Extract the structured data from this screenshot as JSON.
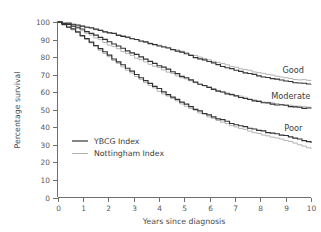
{
  "chart_data": {
    "type": "line",
    "title": "",
    "xlabel": "Years since diagnosis",
    "ylabel": "Percentage survival",
    "xlim": [
      0,
      10
    ],
    "ylim": [
      0,
      100
    ],
    "xticks": [
      "0",
      "1",
      "2",
      "3",
      "4",
      "5",
      "6",
      "7",
      "8",
      "9",
      "10"
    ],
    "yticks": [
      "0",
      "10",
      "20",
      "30",
      "40",
      "50",
      "60",
      "70",
      "80",
      "90",
      "100"
    ],
    "grid": false,
    "legend_position": "inside-lower-left",
    "legend": [
      {
        "name": "YBCG Index",
        "color": "#333333"
      },
      {
        "name": "Nottingham Index",
        "color": "#b3b3b3"
      }
    ],
    "group_annotations": [
      {
        "label": "Good",
        "x": 9.3,
        "y": 71
      },
      {
        "label": "Moderate",
        "x": 9.2,
        "y": 56
      },
      {
        "label": "Poor",
        "x": 9.3,
        "y": 38
      }
    ],
    "x": [
      0,
      0.25,
      0.5,
      0.75,
      1,
      1.25,
      1.5,
      1.75,
      2,
      2.25,
      2.5,
      2.75,
      3,
      3.25,
      3.5,
      3.75,
      4,
      4.25,
      4.5,
      4.75,
      5,
      5.25,
      5.5,
      5.75,
      6,
      6.25,
      6.5,
      6.75,
      7,
      7.25,
      7.5,
      7.75,
      8,
      8.25,
      8.5,
      8.75,
      9,
      9.25,
      9.5,
      9.75,
      10
    ],
    "series": [
      {
        "name": "YBCG Index - Good",
        "group": "Good",
        "index": "YBCG Index",
        "color": "#333333",
        "values": [
          100,
          99.6,
          99.1,
          98.4,
          97.6,
          96.8,
          95.9,
          95.0,
          94.1,
          93.2,
          92.3,
          91.4,
          90.4,
          89.4,
          88.4,
          87.4,
          86.4,
          85.4,
          84.3,
          83.2,
          82.0,
          80.8,
          79.6,
          78.4,
          77.2,
          76.0,
          74.9,
          73.8,
          72.8,
          71.8,
          70.9,
          70.0,
          69.2,
          68.4,
          67.7,
          67.0,
          66.4,
          65.9,
          65.5,
          65.2,
          65.0
        ]
      },
      {
        "name": "Nottingham Index - Good",
        "group": "Good",
        "index": "Nottingham Index",
        "color": "#b3b3b3",
        "values": [
          100,
          99.5,
          99.0,
          98.3,
          97.5,
          96.7,
          95.8,
          94.9,
          94.0,
          93.1,
          92.2,
          91.3,
          90.3,
          89.3,
          88.4,
          87.5,
          86.6,
          85.7,
          84.7,
          83.7,
          82.6,
          81.5,
          80.4,
          79.3,
          78.2,
          77.1,
          76.1,
          75.1,
          74.2,
          73.3,
          72.5,
          71.7,
          70.9,
          70.2,
          69.5,
          68.9,
          68.3,
          67.8,
          67.4,
          67.1,
          66.9
        ]
      },
      {
        "name": "YBCG Index - Moderate",
        "group": "Moderate",
        "index": "YBCG Index",
        "color": "#333333",
        "values": [
          100,
          99.2,
          98.2,
          96.9,
          95.4,
          93.8,
          92.1,
          90.4,
          88.7,
          87.0,
          85.3,
          83.6,
          81.9,
          80.2,
          78.5,
          76.8,
          75.1,
          73.4,
          71.7,
          70.0,
          68.3,
          66.7,
          65.2,
          63.8,
          62.4,
          61.1,
          59.9,
          58.8,
          57.8,
          56.9,
          56.1,
          55.3,
          54.6,
          54.0,
          53.4,
          52.9,
          52.4,
          51.9,
          51.5,
          51.2,
          51.0
        ]
      },
      {
        "name": "Nottingham Index - Moderate",
        "group": "Moderate",
        "index": "Nottingham Index",
        "color": "#b3b3b3",
        "values": [
          100,
          99.0,
          97.8,
          96.3,
          94.6,
          92.8,
          90.9,
          89.0,
          87.1,
          85.3,
          83.5,
          81.8,
          80.1,
          78.4,
          76.8,
          75.2,
          73.6,
          72.1,
          70.6,
          69.1,
          67.7,
          66.4,
          65.1,
          63.9,
          62.7,
          61.5,
          60.4,
          59.3,
          58.3,
          57.4,
          56.5,
          55.7,
          55.0,
          54.4,
          53.8,
          53.3,
          52.8,
          52.4,
          52.1,
          51.9,
          51.8
        ]
      },
      {
        "name": "YBCG Index - Poor",
        "group": "Poor",
        "index": "YBCG Index",
        "color": "#333333",
        "values": [
          100,
          98.4,
          96.4,
          94.1,
          91.6,
          89.0,
          86.3,
          83.6,
          80.9,
          78.3,
          75.7,
          73.2,
          70.7,
          68.3,
          66.0,
          63.7,
          61.5,
          59.4,
          57.3,
          55.3,
          53.3,
          51.5,
          49.8,
          48.2,
          46.7,
          45.3,
          44.0,
          42.8,
          41.7,
          40.7,
          39.8,
          38.9,
          38.1,
          37.4,
          36.7,
          36.0,
          35.2,
          34.3,
          33.3,
          32.3,
          31.5
        ]
      },
      {
        "name": "Nottingham Index - Poor",
        "group": "Poor",
        "index": "Nottingham Index",
        "color": "#b3b3b3",
        "values": [
          100,
          98.2,
          96.1,
          93.7,
          91.1,
          88.4,
          85.6,
          82.8,
          80.0,
          77.3,
          74.7,
          72.1,
          69.6,
          67.2,
          64.9,
          62.6,
          60.4,
          58.3,
          56.3,
          54.3,
          52.4,
          50.6,
          48.9,
          47.3,
          45.7,
          44.2,
          42.8,
          41.5,
          40.3,
          39.2,
          38.1,
          37.1,
          36.2,
          35.3,
          34.4,
          33.5,
          32.5,
          31.4,
          30.2,
          29.0,
          28.0
        ]
      }
    ]
  },
  "axes": {
    "y_title": "Percentage survival",
    "x_title": "Years since diagnosis"
  }
}
